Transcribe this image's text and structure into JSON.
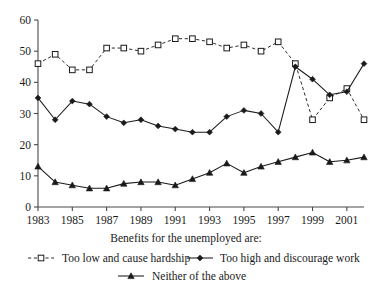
{
  "chart_data": {
    "type": "line",
    "title": "",
    "subtitle": "",
    "xlabel": "Benefits for the unemployed are:",
    "ylabel": "",
    "x": [
      1983,
      1984,
      1985,
      1986,
      1987,
      1988,
      1989,
      1990,
      1991,
      1992,
      1993,
      1994,
      1995,
      1996,
      1997,
      1998,
      1999,
      2000,
      2001,
      2002
    ],
    "xtick_labels": [
      "1983",
      "1985",
      "1987",
      "1989",
      "1991",
      "1993",
      "1995",
      "1997",
      "1999",
      "2001"
    ],
    "xtick_values": [
      1983,
      1985,
      1987,
      1989,
      1991,
      1993,
      1995,
      1997,
      1999,
      2001
    ],
    "ytick_labels": [
      "0",
      "10",
      "20",
      "30",
      "40",
      "50",
      "60"
    ],
    "ytick_values": [
      0,
      10,
      20,
      30,
      40,
      50,
      60
    ],
    "xlim": [
      1983,
      2002
    ],
    "ylim": [
      0,
      60
    ],
    "grid": false,
    "legend_position": "bottom",
    "series": [
      {
        "name": "Too low and cause hardship",
        "marker": "open-square",
        "line_style": "dashed",
        "color": "#2b2b2b",
        "values": [
          46,
          49,
          44,
          44,
          51,
          51,
          50,
          52,
          54,
          54,
          53,
          51,
          52,
          50,
          53,
          46,
          28,
          35,
          38,
          28
        ]
      },
      {
        "name": "Too high and discourage work",
        "marker": "filled-diamond",
        "line_style": "solid",
        "color": "#1a1a1a",
        "values": [
          35,
          28,
          34,
          33,
          29,
          27,
          28,
          26,
          25,
          24,
          24,
          29,
          31,
          30,
          24,
          45,
          41,
          36,
          37,
          46
        ]
      },
      {
        "name": "Neither of the above",
        "marker": "filled-triangle",
        "line_style": "solid",
        "color": "#1a1a1a",
        "values": [
          13,
          8,
          7,
          6,
          6,
          7.5,
          8,
          8,
          7,
          9,
          11,
          14,
          11,
          13,
          14.5,
          16,
          17.5,
          14.5,
          15,
          16
        ]
      }
    ]
  },
  "legend": {
    "items": [
      {
        "label": "Too low and cause hardship",
        "marker": "open-square",
        "style": "dashed"
      },
      {
        "label": "Too high and discourage work",
        "marker": "filled-diamond",
        "style": "solid"
      },
      {
        "label": "Neither of the above",
        "marker": "filled-triangle",
        "style": "solid"
      }
    ]
  }
}
